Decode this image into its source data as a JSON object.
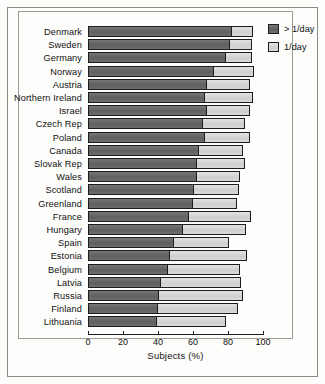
{
  "chart_data": {
    "type": "bar",
    "orientation": "horizontal",
    "stacked": true,
    "title": "",
    "xlabel": "Subjects (%)",
    "ylabel": "",
    "xlim": [
      0,
      100
    ],
    "xticks": [
      0,
      20,
      40,
      60,
      80,
      100
    ],
    "xtick_labels": [
      "0",
      "20",
      "40",
      "60",
      "80",
      "100"
    ],
    "grid": false,
    "legend_position": "top-right",
    "categories": [
      "Denmark",
      "Sweden",
      "Germany",
      "Norway",
      "Austria",
      "Northern Ireland",
      "Israel",
      "Czech Rep",
      "Poland",
      "Canada",
      "Slovak Rep",
      "Wales",
      "Scotland",
      "Greenland",
      "France",
      "Hungary",
      "Spain",
      "Estonia",
      "Belgium",
      "Latvia",
      "Russia",
      "Finland",
      "Lithuania"
    ],
    "series": [
      {
        "name": "> 1/day",
        "color": "#6a6a6a",
        "values": [
          82.5,
          81.5,
          79.0,
          72.5,
          68.0,
          67.0,
          68.0,
          66.0,
          67.0,
          63.5,
          62.5,
          62.5,
          61.0,
          60.0,
          58.0,
          54.5,
          49.0,
          47.0,
          45.5,
          41.5,
          40.5,
          40.0,
          39.5
        ]
      },
      {
        "name": "1/day",
        "color": "#d6d6d6",
        "values": [
          12.0,
          12.0,
          14.5,
          22.5,
          24.5,
          27.5,
          24.5,
          23.5,
          25.5,
          25.0,
          27.0,
          24.5,
          25.5,
          25.0,
          35.0,
          35.5,
          31.5,
          44.0,
          41.5,
          46.0,
          48.0,
          45.5,
          39.5
        ]
      }
    ],
    "totals": [
      94.5,
      93.5,
      93.5,
      95.0,
      92.5,
      94.5,
      92.5,
      89.5,
      92.5,
      88.5,
      89.5,
      87.0,
      86.5,
      85.0,
      93.0,
      90.0,
      80.5,
      91.0,
      87.0,
      87.5,
      88.5,
      85.5,
      79.0
    ]
  },
  "legend": {
    "items": [
      {
        "label": "> 1/day",
        "swatch": "dark"
      },
      {
        "label": "1/day",
        "swatch": "light"
      }
    ]
  },
  "axis": {
    "title": "Subjects (%)"
  }
}
